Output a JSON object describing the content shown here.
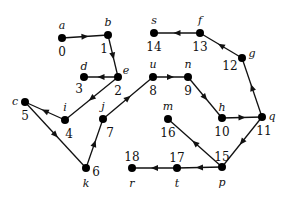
{
  "diagram": {
    "type": "directed-graph",
    "nodes": [
      {
        "id": 0,
        "number": "0",
        "label": "a",
        "x": 62,
        "y": 38,
        "num_dx": 0,
        "num_dy": 14,
        "lbl_dx": 0,
        "lbl_dy": -12
      },
      {
        "id": 1,
        "number": "1",
        "label": "b",
        "x": 108,
        "y": 35,
        "num_dx": -4,
        "num_dy": 14,
        "lbl_dx": 0,
        "lbl_dy": -12
      },
      {
        "id": 2,
        "number": "2",
        "label": "e",
        "x": 118,
        "y": 77,
        "num_dx": 0,
        "num_dy": 14,
        "lbl_dx": 8,
        "lbl_dy": -6
      },
      {
        "id": 3,
        "number": "3",
        "label": "d",
        "x": 84,
        "y": 77,
        "num_dx": -5,
        "num_dy": 12,
        "lbl_dx": 0,
        "lbl_dy": -10
      },
      {
        "id": 4,
        "number": "4",
        "label": "i",
        "x": 65,
        "y": 120,
        "num_dx": 4,
        "num_dy": 14,
        "lbl_dx": 0,
        "lbl_dy": -12
      },
      {
        "id": 5,
        "number": "5",
        "label": "c",
        "x": 25,
        "y": 102,
        "num_dx": 0,
        "num_dy": 14,
        "lbl_dx": -10,
        "lbl_dy": 0
      },
      {
        "id": 6,
        "number": "6",
        "label": "k",
        "x": 86,
        "y": 168,
        "num_dx": 10,
        "num_dy": 4,
        "lbl_dx": 0,
        "lbl_dy": 16
      },
      {
        "id": 7,
        "number": "7",
        "label": "j",
        "x": 103,
        "y": 119,
        "num_dx": 7,
        "num_dy": 14,
        "lbl_dx": 0,
        "lbl_dy": -12
      },
      {
        "id": 8,
        "number": "8",
        "label": "u",
        "x": 153,
        "y": 77,
        "num_dx": 0,
        "num_dy": 14,
        "lbl_dx": 0,
        "lbl_dy": -12
      },
      {
        "id": 9,
        "number": "9",
        "label": "n",
        "x": 188,
        "y": 77,
        "num_dx": 0,
        "num_dy": 14,
        "lbl_dx": 0,
        "lbl_dy": -12
      },
      {
        "id": 10,
        "number": "10",
        "label": "h",
        "x": 222,
        "y": 118,
        "num_dx": 0,
        "num_dy": 14,
        "lbl_dx": 0,
        "lbl_dy": -10
      },
      {
        "id": 11,
        "number": "11",
        "label": "q",
        "x": 262,
        "y": 117,
        "num_dx": 2,
        "num_dy": 14,
        "lbl_dx": 10,
        "lbl_dy": 0
      },
      {
        "id": 12,
        "number": "12",
        "label": "g",
        "x": 242,
        "y": 58,
        "num_dx": -12,
        "num_dy": 8,
        "lbl_dx": 10,
        "lbl_dy": -4
      },
      {
        "id": 13,
        "number": "13",
        "label": "f",
        "x": 200,
        "y": 33,
        "num_dx": 0,
        "num_dy": 14,
        "lbl_dx": 0,
        "lbl_dy": -12
      },
      {
        "id": 14,
        "number": "14",
        "label": "s",
        "x": 154,
        "y": 33,
        "num_dx": 0,
        "num_dy": 14,
        "lbl_dx": 0,
        "lbl_dy": -12
      },
      {
        "id": 15,
        "number": "15",
        "label": "p",
        "x": 222,
        "y": 167,
        "num_dx": 0,
        "num_dy": -10,
        "lbl_dx": 0,
        "lbl_dy": 16
      },
      {
        "id": 16,
        "number": "16",
        "label": "m",
        "x": 168,
        "y": 119,
        "num_dx": 0,
        "num_dy": 14,
        "lbl_dx": 0,
        "lbl_dy": -12
      },
      {
        "id": 17,
        "number": "17",
        "label": "t",
        "x": 177,
        "y": 168,
        "num_dx": 0,
        "num_dy": -10,
        "lbl_dx": 0,
        "lbl_dy": 16
      },
      {
        "id": 18,
        "number": "18",
        "label": "r",
        "x": 132,
        "y": 168,
        "num_dx": 0,
        "num_dy": -11,
        "lbl_dx": 0,
        "lbl_dy": 16
      }
    ],
    "edges": [
      {
        "from": 0,
        "to": 1
      },
      {
        "from": 1,
        "to": 2
      },
      {
        "from": 2,
        "to": 3
      },
      {
        "from": 2,
        "to": 4
      },
      {
        "from": 4,
        "to": 5
      },
      {
        "from": 5,
        "to": 6
      },
      {
        "from": 6,
        "to": 7
      },
      {
        "from": 7,
        "to": 8
      },
      {
        "from": 8,
        "to": 9
      },
      {
        "from": 9,
        "to": 10
      },
      {
        "from": 10,
        "to": 11
      },
      {
        "from": 11,
        "to": 12
      },
      {
        "from": 12,
        "to": 13
      },
      {
        "from": 13,
        "to": 14
      },
      {
        "from": 11,
        "to": 15
      },
      {
        "from": 15,
        "to": 16
      },
      {
        "from": 15,
        "to": 17
      },
      {
        "from": 17,
        "to": 18
      }
    ],
    "colors": {
      "stroke": "#111111",
      "node": "#000000",
      "background": "#ffffff"
    }
  }
}
